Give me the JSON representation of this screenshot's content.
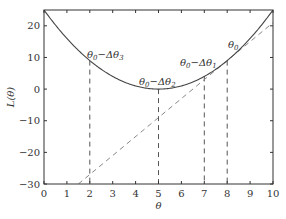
{
  "chart_data": {
    "type": "line",
    "title": "",
    "xlabel": "θ",
    "ylabel": "L(θ)",
    "xlim": [
      0,
      10
    ],
    "ylim": [
      -30,
      25
    ],
    "xticks": [
      0,
      1,
      2,
      3,
      4,
      5,
      6,
      7,
      8,
      9,
      10
    ],
    "yticks": [
      -30,
      -20,
      -10,
      0,
      10,
      20
    ],
    "grid": false,
    "series": [
      {
        "name": "L(θ)",
        "style": "solid",
        "formula": "(θ-5)^2",
        "x": [
          0,
          1,
          2,
          3,
          4,
          5,
          6,
          7,
          8,
          9,
          10
        ],
        "y": [
          25,
          16,
          9,
          4,
          1,
          0,
          1,
          4,
          9,
          16,
          25
        ]
      },
      {
        "name": "tangent at θ0",
        "style": "dashed",
        "formula": "9 + 6(θ-8)",
        "x": [
          1.5,
          10
        ],
        "y": [
          -30,
          21
        ]
      }
    ],
    "vertical_dashed_lines": [
      {
        "x": 2,
        "y_top": 9
      },
      {
        "x": 5,
        "y_top": 0
      },
      {
        "x": 7,
        "y_top": 4
      },
      {
        "x": 8,
        "y_top": 9
      }
    ],
    "annotations": [
      {
        "text": "θ0−Δθ3",
        "x": 2,
        "y": 9
      },
      {
        "text": "θ0−Δθ2",
        "x": 5,
        "y": 0
      },
      {
        "text": "θ0−Δθ1",
        "x": 7,
        "y": 4
      },
      {
        "text": "θ0",
        "x": 8,
        "y": 9
      }
    ]
  },
  "labels": {
    "xlabel": "θ",
    "ylabel": "L(θ)",
    "ann3": "θ0−Δθ3",
    "ann2": "θ0−Δθ2",
    "ann1": "θ0−Δθ1",
    "ann0": "θ0"
  }
}
